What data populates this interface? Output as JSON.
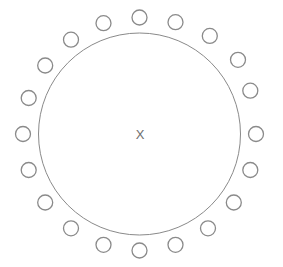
{
  "canvas": {
    "width": 283,
    "height": 267,
    "background_color": "#ffffff"
  },
  "diagram": {
    "title": "",
    "center_label": "X",
    "center_label_color": "#6e6e6e",
    "stroke_color": "#8a8a8a",
    "small_circle_stroke_color": "#8a8a8a",
    "fill": "none",
    "center": {
      "x": 139.5,
      "y": 134
    },
    "main_circle": {
      "name": "main-circle",
      "radius": 101,
      "stroke_width": 1
    },
    "ring": {
      "name": "satellite-ring",
      "count": 20,
      "orbit_radius": 116.5,
      "start_angle_deg": -90,
      "step_angle_deg": 18,
      "node_radius": 7.5,
      "node_stroke_width": 1.3
    },
    "nodes": [
      {
        "index": 1,
        "angle_deg": -90,
        "cx": 139.5,
        "cy": 17.5
      },
      {
        "index": 2,
        "angle_deg": -72,
        "cx": 175.5,
        "cy": 22.2
      },
      {
        "index": 3,
        "angle_deg": -54,
        "cx": 209.8,
        "cy": 35.9
      },
      {
        "index": 4,
        "angle_deg": -36,
        "cx": 238.0,
        "cy": 59.8
      },
      {
        "index": 5,
        "angle_deg": -18,
        "cx": 250.3,
        "cy": 90.7
      },
      {
        "index": 6,
        "angle_deg": 0,
        "cx": 256.0,
        "cy": 134.0
      },
      {
        "index": 7,
        "angle_deg": 18,
        "cx": 250.3,
        "cy": 170.0
      },
      {
        "index": 8,
        "angle_deg": 36,
        "cx": 233.8,
        "cy": 202.5
      },
      {
        "index": 9,
        "angle_deg": 54,
        "cx": 208.0,
        "cy": 228.3
      },
      {
        "index": 10,
        "angle_deg": 72,
        "cx": 175.5,
        "cy": 244.8
      },
      {
        "index": 11,
        "angle_deg": 90,
        "cx": 139.5,
        "cy": 250.5
      },
      {
        "index": 12,
        "angle_deg": 108,
        "cx": 103.5,
        "cy": 244.8
      },
      {
        "index": 13,
        "angle_deg": 126,
        "cx": 71.0,
        "cy": 228.3
      },
      {
        "index": 14,
        "angle_deg": 144,
        "cx": 45.2,
        "cy": 202.5
      },
      {
        "index": 15,
        "angle_deg": 162,
        "cx": 28.7,
        "cy": 170.0
      },
      {
        "index": 16,
        "angle_deg": 180,
        "cx": 23.0,
        "cy": 134.0
      },
      {
        "index": 17,
        "angle_deg": 198,
        "cx": 28.7,
        "cy": 98.0
      },
      {
        "index": 18,
        "angle_deg": 216,
        "cx": 45.2,
        "cy": 65.5
      },
      {
        "index": 19,
        "angle_deg": 234,
        "cx": 71.0,
        "cy": 39.7
      },
      {
        "index": 20,
        "angle_deg": 252,
        "cx": 103.5,
        "cy": 23.2
      }
    ]
  }
}
